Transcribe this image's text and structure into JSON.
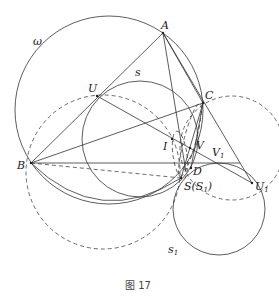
{
  "figure": {
    "caption": "图 17",
    "labels": {
      "A": "A",
      "B": "B",
      "C": "C",
      "U": "U",
      "I": "I",
      "V": "V",
      "D": "D",
      "S": "S(S",
      "S_sub": "1",
      "S_close": ")",
      "V1": "V",
      "V1_sub": "1",
      "U1": "U",
      "U1_sub": "1",
      "omega": "ω",
      "s": "s",
      "s1": "s",
      "s1_sub": "1"
    },
    "points": {
      "A": [
        163,
        33
      ],
      "B": [
        31,
        163
      ],
      "C": [
        203,
        103
      ],
      "U": [
        97,
        96
      ],
      "I": [
        172,
        139
      ],
      "V": [
        190,
        143
      ],
      "D": [
        191,
        168
      ],
      "S": [
        181,
        178
      ],
      "U1": [
        252,
        183
      ],
      "V1": [
        218,
        163
      ]
    },
    "circles": [
      {
        "name": "omega",
        "style": "solid",
        "center": [
          109,
          110
        ],
        "r": 94
      },
      {
        "name": "s",
        "style": "solid",
        "center": [
          140,
          139
        ],
        "r": 58
      },
      {
        "name": "circle-BUS",
        "style": "dashed",
        "center": [
          103,
          172
        ],
        "r": 77
      },
      {
        "name": "circle-C-U1",
        "style": "dashed",
        "center": [
          232,
          148
        ],
        "r": 52
      },
      {
        "name": "s1",
        "style": "solid",
        "center": [
          219,
          209
        ],
        "r": 46
      }
    ]
  }
}
